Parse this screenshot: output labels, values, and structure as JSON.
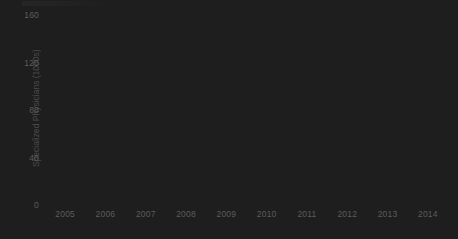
{
  "chart_data": {
    "type": "bar",
    "title": "",
    "xlabel": "",
    "ylabel": "Specialized Physicians (1000s)",
    "categories": [
      "2005",
      "2006",
      "2007",
      "2008",
      "2009",
      "2010",
      "2011",
      "2012",
      "2013",
      "2014"
    ],
    "values": [
      103,
      111,
      109,
      116,
      120,
      121,
      128,
      129,
      137,
      152
    ],
    "ylim": [
      0,
      160
    ],
    "yticks": [
      "0",
      "40",
      "80",
      "120",
      "160"
    ],
    "ytick_values": [
      0,
      40,
      80,
      120,
      160
    ],
    "grid": true,
    "legend": false,
    "bar_color": "#1e1e1e",
    "gridline_color": "#ebebeb",
    "tick_label_color": "#5c5c5c",
    "background_color": "#ffffff"
  }
}
